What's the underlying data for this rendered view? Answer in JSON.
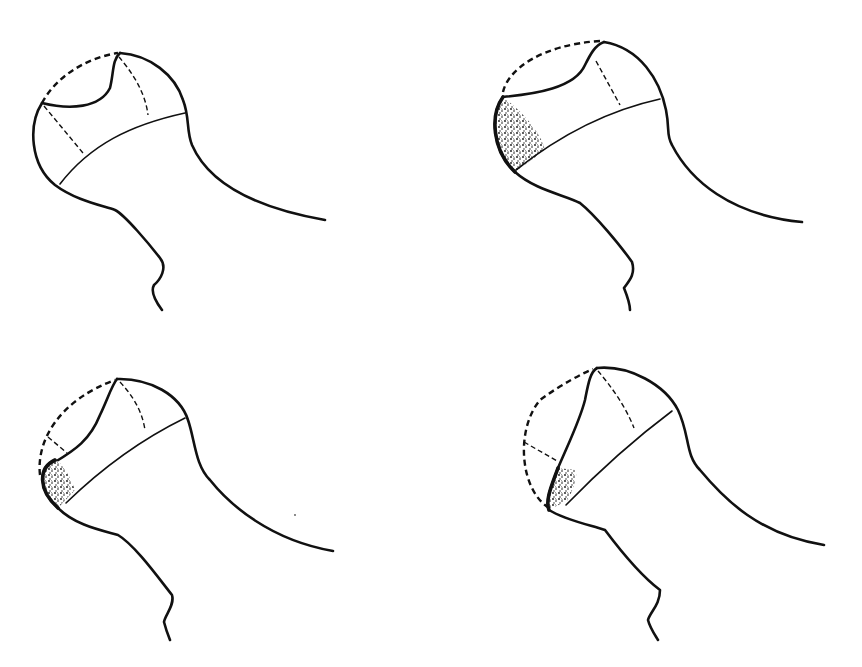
{
  "figure": {
    "ink_color": "#111111",
    "background_color": "#ffffff",
    "panels": [
      {
        "id": "panel-1",
        "position": "top-left",
        "has_stippled_region": false
      },
      {
        "id": "panel-2",
        "position": "top-right",
        "has_stippled_region": true
      },
      {
        "id": "panel-3",
        "position": "bottom-left",
        "has_stippled_region": true
      },
      {
        "id": "panel-4",
        "position": "bottom-right",
        "has_stippled_region": true
      }
    ]
  }
}
